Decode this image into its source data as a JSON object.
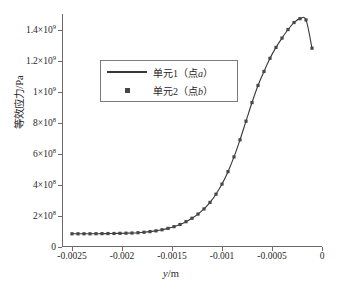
{
  "chart_data": {
    "type": "line",
    "title": "",
    "xlabel": "y/m",
    "ylabel": "等效应力/Pa",
    "xlim": [
      -0.0026,
      0.0
    ],
    "ylim": [
      0,
      1500000000.0
    ],
    "grid": false,
    "legend_position": "upper-left-inside",
    "xticks": [
      -0.0025,
      -0.002,
      -0.0015,
      -0.001,
      -0.0005,
      0
    ],
    "xticklabels": [
      "-0.0025",
      "-0.002",
      "-0.0015",
      "-0.001",
      "-0.0005",
      "0"
    ],
    "yticks": [
      0,
      200000000,
      400000000,
      600000000,
      800000000,
      1000000000,
      1200000000,
      1400000000
    ],
    "yticklabels": [
      "0",
      "2×10<sup>8</sup>",
      "4×10<sup>8</sup>",
      "6×10<sup>8</sup>",
      "8×10<sup>8</sup>",
      "1×10<sup>9</sup>",
      "1.2×10<sup>9</sup>",
      "1.4×10<sup>9</sup>"
    ],
    "series": [
      {
        "name": "单元1（点a）",
        "style": "line",
        "color": "#3a3537",
        "x": [
          -0.0025,
          -0.00244,
          -0.00238,
          -0.00232,
          -0.00226,
          -0.0022,
          -0.00214,
          -0.00208,
          -0.00202,
          -0.00196,
          -0.0019,
          -0.00184,
          -0.00178,
          -0.00172,
          -0.00166,
          -0.0016,
          -0.00154,
          -0.00148,
          -0.00142,
          -0.00136,
          -0.0013,
          -0.00124,
          -0.00118,
          -0.00112,
          -0.00106,
          -0.001,
          -0.00094,
          -0.00088,
          -0.00082,
          -0.00076,
          -0.0007,
          -0.00064,
          -0.00058,
          -0.00052,
          -0.00046,
          -0.0004,
          -0.00034,
          -0.00028,
          -0.00022,
          -0.00016,
          -0.0001
        ],
        "y": [
          85000000,
          85000000,
          85000000,
          85000000,
          85500000,
          86000000,
          86500000,
          87000000,
          88000000,
          89000000,
          90000000,
          92000000,
          95000000,
          99000000,
          104000000,
          111000000,
          120000000,
          131000000,
          145000000,
          163000000,
          185000000,
          212000000,
          245000000,
          287000000,
          340000000,
          405000000,
          485000000,
          580000000,
          690000000,
          810000000,
          930000000,
          1040000000,
          1130000000,
          1215000000,
          1285000000,
          1345000000,
          1400000000,
          1445000000,
          1470000000,
          1462000000,
          1280000000
        ]
      },
      {
        "name": "单元2（点b）",
        "style": "marker",
        "marker": "square",
        "color": "#4a4547",
        "x": [
          -0.0025,
          -0.00244,
          -0.00238,
          -0.00232,
          -0.00226,
          -0.0022,
          -0.00214,
          -0.00208,
          -0.00202,
          -0.00196,
          -0.0019,
          -0.00184,
          -0.00178,
          -0.00172,
          -0.00166,
          -0.0016,
          -0.00154,
          -0.00148,
          -0.00142,
          -0.00136,
          -0.0013,
          -0.00124,
          -0.00118,
          -0.00112,
          -0.00106,
          -0.001,
          -0.00094,
          -0.00088,
          -0.00082,
          -0.00076,
          -0.0007,
          -0.00064,
          -0.00058,
          -0.00052,
          -0.00046,
          -0.0004,
          -0.00034,
          -0.00028,
          -0.00022,
          -0.00016,
          -0.0001
        ],
        "y": [
          85000000,
          85000000,
          85000000,
          85000000,
          85500000,
          86000000,
          86500000,
          87000000,
          88000000,
          89000000,
          90000000,
          92000000,
          95000000,
          99000000,
          104000000,
          111000000,
          120000000,
          131000000,
          145000000,
          163000000,
          185000000,
          212000000,
          245000000,
          287000000,
          340000000,
          405000000,
          485000000,
          580000000,
          690000000,
          810000000,
          930000000,
          1040000000,
          1130000000,
          1215000000,
          1285000000,
          1345000000,
          1400000000,
          1445000000,
          1470000000,
          1462000000,
          1280000000
        ]
      }
    ]
  },
  "axes": {
    "y_title": "等效应力/Pa",
    "x_title_var": "y",
    "x_title_unit": "/m"
  },
  "legend": {
    "entries": [
      {
        "label_prefix": "单元1（点",
        "label_var": "a",
        "label_suffix": "）",
        "key": "line"
      },
      {
        "label_prefix": "单元2（点",
        "label_var": "b",
        "label_suffix": "）",
        "key": "square"
      }
    ]
  },
  "colors": {
    "axis": "#6e6a6b",
    "curve": "#3a3537",
    "marker": "#4a4547",
    "text": "#2a2626",
    "background": "#ffffff"
  }
}
